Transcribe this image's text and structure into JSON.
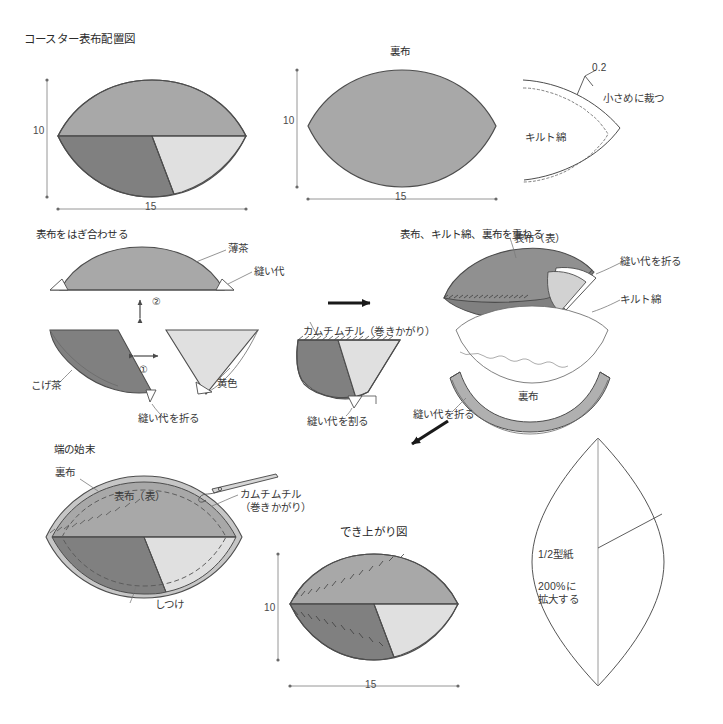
{
  "document": {
    "title": "コースター表布配置図",
    "language": "ja",
    "kind": "sewing-instruction-diagram"
  },
  "colors": {
    "light_brown": "#a8a8a8",
    "dark_brown": "#808080",
    "yellow": "#e0e0e0",
    "backing_gray": "#b0b0b0",
    "batting_white": "#ffffff",
    "outline": "#4d4d4d",
    "text": "#3a3a3a",
    "arrow": "#1a1a1a",
    "pattern_line": "#555555"
  },
  "panels": {
    "top_left": {
      "title": "コースター表布配置図",
      "dim_height": "10",
      "dim_width": "15"
    },
    "top_mid": {
      "label": "裏布",
      "dim_height": "10",
      "dim_width": "15"
    },
    "top_right": {
      "gap_value": "0.2",
      "note": "小さめに裁つ",
      "material": "キルト綿"
    },
    "mid_left": {
      "heading": "表布をはぎ合わせる",
      "label_light_brown": "薄茶",
      "label_seam": "縫い代",
      "label_dark_brown": "こげ茶",
      "label_yellow": "黄色",
      "label_fold_seam": "縫い代を折る",
      "step_one": "①",
      "step_two": "②"
    },
    "mid_center": {
      "label_stitch": "カムチムチル（巻きかがり）",
      "label_open_seam": "縫い代を割る"
    },
    "mid_right": {
      "heading": "表布、キルト綿、裏布を重ねる",
      "label_top_fabric": "表布（表）",
      "label_fold_seam_top": "縫い代を折る",
      "label_batting": "キルト綿",
      "label_backing": "裏布",
      "label_fold_seam_bottom": "縫い代を折る"
    },
    "bottom_left": {
      "heading": "端の始末",
      "label_backing": "裏布",
      "label_top_fabric": "表布（表）",
      "label_stitch": "カムチムチル\n（巻きかがり）",
      "label_basting": "しつけ"
    },
    "bottom_center": {
      "title": "でき上がり図",
      "dim_height": "10",
      "dim_width": "15"
    },
    "bottom_right": {
      "label_pattern": "1/2型紙",
      "label_scale": "200%に\n拡大する"
    }
  },
  "arrows": [
    {
      "name": "arrow-right-to-joined",
      "direction": "right"
    },
    {
      "name": "arrow-down-left-to-finish",
      "direction": "down-left"
    },
    {
      "name": "arrow-updown-step2",
      "direction": "up-down"
    },
    {
      "name": "arrow-leftright-step1",
      "direction": "left-right"
    }
  ]
}
